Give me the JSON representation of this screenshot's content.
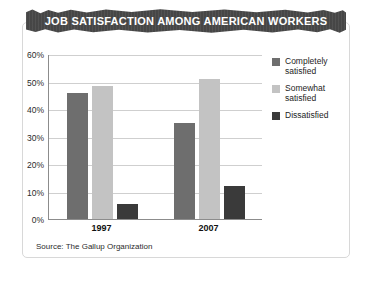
{
  "chart_data": {
    "type": "bar",
    "title": "JOB SATISFACTION AMONG AMERICAN WORKERS",
    "xlabel": "",
    "ylabel": "",
    "categories": [
      "1997",
      "2007"
    ],
    "series": [
      {
        "name": "Completely\nsatisfied",
        "color": "#6e6e6e",
        "values": [
          46,
          35
        ]
      },
      {
        "name": "Somewhat\nsatisfied",
        "color": "#c3c3c3",
        "values": [
          48.5,
          51
        ]
      },
      {
        "name": "Dissatisfied",
        "color": "#3a3a3a",
        "values": [
          5.5,
          12
        ]
      }
    ],
    "ylim": [
      0,
      60
    ],
    "yticks": [
      0,
      10,
      20,
      30,
      40,
      50,
      60
    ],
    "ytick_labels": [
      "0%",
      "10%",
      "20%",
      "30%",
      "40%",
      "50%",
      "60%"
    ],
    "grid": true,
    "legend_position": "right",
    "source": "Source: The Gallup Organization"
  },
  "colors": {
    "banner_background": "#4a4a4a",
    "banner_text": "#ffffff",
    "card_border": "#d8d8d8",
    "axis": "#8c8c8c",
    "gridline": "#cfcfcf",
    "completely_satisfied": "#6e6e6e",
    "somewhat_satisfied": "#c3c3c3",
    "dissatisfied": "#3a3a3a"
  }
}
